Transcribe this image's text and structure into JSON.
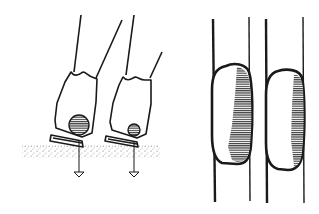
{
  "figure": {
    "colors": {
      "ink": "#1a1a1a",
      "background": "#ffffff",
      "stipple": "#555555"
    },
    "left_panel": {
      "items": [
        {
          "label": "",
          "ball_size": "large"
        },
        {
          "label": "",
          "ball_size": "small"
        }
      ],
      "ground": "stippled surface with downward arrows"
    },
    "right_panel": {
      "items": [
        {
          "label": "",
          "shading": "large hatched region"
        },
        {
          "label": "",
          "shading": "narrow hatched region"
        }
      ]
    }
  }
}
